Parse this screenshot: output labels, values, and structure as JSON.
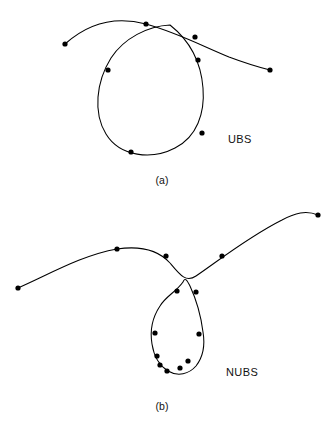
{
  "figure": {
    "background_color": "#ffffff",
    "ink_color": "#000000",
    "panels": [
      {
        "id": "panel-a",
        "caption": "(a)",
        "curve_label": "UBS",
        "curve_label_name": "uniform-b-spline",
        "dot_radius": 2.6,
        "stroke_width": 1.05,
        "open_arc_path": "M 65,44 C 85,26 112,15 146,24 C 178,33 200,45 229,57 C 245,63 258,67 270,70",
        "loop_path": "M 170,25 C 148,26 124,38 111,58 C 96,82 93,113 106,134 C 120,157 152,160 175,148 C 197,137 205,113 203,88 C 201,62 189,40 170,25",
        "control_points": [
          {
            "name": "arc-endpoint-left",
            "x": 65,
            "y": 44
          },
          {
            "name": "arc-apex",
            "x": 146,
            "y": 24
          },
          {
            "name": "arc-midright",
            "x": 195,
            "y": 37
          },
          {
            "name": "arc-endpoint-right",
            "x": 270,
            "y": 70
          },
          {
            "name": "loop-upper-left",
            "x": 108,
            "y": 70
          },
          {
            "name": "loop-upper-right",
            "x": 198,
            "y": 60
          },
          {
            "name": "loop-lower-right",
            "x": 202,
            "y": 133
          },
          {
            "name": "loop-bottom",
            "x": 131,
            "y": 152
          }
        ]
      },
      {
        "id": "panel-b",
        "caption": "(b)",
        "curve_label": "NUBS",
        "curve_label_name": "non-uniform-b-spline",
        "dot_radius": 2.6,
        "stroke_width": 1.05,
        "open_arc_path": "M 18,288 C 48,275 82,255 117,249 C 144,245 160,252 170,263 C 180,275 186,283 196,276 C 214,264 248,237 282,220 C 295,213 306,210 318,215",
        "loop_path": "M 183,282 C 176,292 166,296 160,306 C 152,318 150,332 152,344 C 154,357 160,366 168,371 C 178,377 189,374 196,366 C 203,357 205,344 203,332 C 201,316 196,299 190,286 C 187,280 185,277 183,282",
        "control_points": [
          {
            "name": "arc-endpoint-left",
            "x": 18,
            "y": 288
          },
          {
            "name": "arc-left-upper",
            "x": 117,
            "y": 249
          },
          {
            "name": "arc-near-loop",
            "x": 166,
            "y": 256
          },
          {
            "name": "arc-right-mid",
            "x": 222,
            "y": 256
          },
          {
            "name": "arc-endpoint-right",
            "x": 318,
            "y": 215
          },
          {
            "name": "loop-top-left",
            "x": 177,
            "y": 291
          },
          {
            "name": "loop-top-right",
            "x": 196,
            "y": 292
          },
          {
            "name": "loop-left-mid",
            "x": 155,
            "y": 333
          },
          {
            "name": "loop-right-mid",
            "x": 199,
            "y": 334
          },
          {
            "name": "loop-lower-left",
            "x": 157,
            "y": 356
          },
          {
            "name": "loop-lower-left-2",
            "x": 160,
            "y": 365
          },
          {
            "name": "loop-bottom",
            "x": 167,
            "y": 371
          },
          {
            "name": "loop-bottom-right",
            "x": 180,
            "y": 368
          },
          {
            "name": "loop-right-lower",
            "x": 188,
            "y": 361
          }
        ]
      }
    ]
  }
}
